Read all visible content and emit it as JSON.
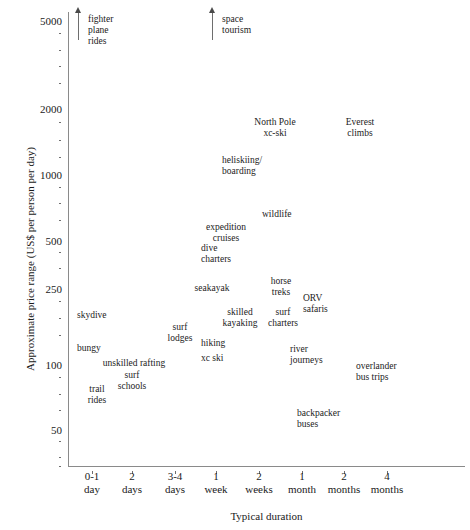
{
  "chart_data": {
    "type": "scatter",
    "title": "",
    "xlabel": "Typical duration",
    "ylabel": "Approximate price range (US$ per person per day)",
    "yscale": "log",
    "ylim": [
      30,
      6000
    ],
    "y_tick_labels": [
      "5000",
      "2000",
      "1000",
      "500",
      "250",
      "100",
      "50"
    ],
    "y_tick_values": [
      5000,
      2000,
      1000,
      500,
      250,
      100,
      50
    ],
    "x_tick_labels": [
      {
        "line1": "0-1",
        "line2": "day"
      },
      {
        "line1": "2",
        "line2": "days"
      },
      {
        "line1": "3-4",
        "line2": "days"
      },
      {
        "line1": "1",
        "line2": "week"
      },
      {
        "line1": "2",
        "line2": "weeks"
      },
      {
        "line1": "1",
        "line2": "month"
      },
      {
        "line1": "2",
        "line2": "months"
      },
      {
        "line1": "4",
        "line2": "months"
      }
    ],
    "grid": false,
    "legend": "none",
    "points": [
      {
        "label": "fighter\nplane\nrides",
        "x_category": "0-1 day",
        "y_value": 5000,
        "off_scale": true,
        "align": "left"
      },
      {
        "label": "space\ntourism",
        "x_category": "1 week",
        "y_value": 5000,
        "off_scale": true,
        "align": "left"
      },
      {
        "label": "North Pole\nxc-ski",
        "x_category": "2 weeks",
        "y_value": 1700,
        "off_scale": false,
        "align": "center"
      },
      {
        "label": "Everest\nclimbs",
        "x_category": "2 months",
        "y_value": 1700,
        "off_scale": false,
        "align": "center"
      },
      {
        "label": "heliskiing/\nboarding",
        "x_category": "1 week",
        "y_value": 1050,
        "off_scale": false,
        "align": "left"
      },
      {
        "label": "expedition\ncruises",
        "x_category": "2 weeks",
        "y_value": 560,
        "off_scale": false,
        "align": "left"
      },
      {
        "label": "wildlife",
        "x_category": "1 week",
        "y_value": 500,
        "off_scale": false,
        "align": "center"
      },
      {
        "label": "dive\ncharters",
        "x_category": "1 week",
        "y_value": 400,
        "off_scale": false,
        "align": "left"
      },
      {
        "label": "seakayak",
        "x_category": "1 week",
        "y_value": 270,
        "off_scale": false,
        "align": "center"
      },
      {
        "label": "horse\ntreks",
        "x_category": "2 weeks",
        "y_value": 270,
        "off_scale": false,
        "align": "center"
      },
      {
        "label": "ORV\nsafaris",
        "x_category": "1 month",
        "y_value": 245,
        "off_scale": false,
        "align": "left"
      },
      {
        "label": "skilled\nkayaking",
        "x_category": "1 week",
        "y_value": 200,
        "off_scale": false,
        "align": "center"
      },
      {
        "label": "surf\ncharters",
        "x_category": "2 weeks",
        "y_value": 200,
        "off_scale": false,
        "align": "center"
      },
      {
        "label": "skydive",
        "x_category": "0-1 day",
        "y_value": 190,
        "off_scale": false,
        "align": "left"
      },
      {
        "label": "surf\nlodges",
        "x_category": "3-4 days",
        "y_value": 160,
        "off_scale": false,
        "align": "center"
      },
      {
        "label": "hiking",
        "x_category": "1 week",
        "y_value": 140,
        "off_scale": false,
        "align": "left"
      },
      {
        "label": "bungy",
        "x_category": "0-1 day",
        "y_value": 135,
        "off_scale": false,
        "align": "left"
      },
      {
        "label": "river\njourneys",
        "x_category": "1 month",
        "y_value": 128,
        "off_scale": false,
        "align": "left"
      },
      {
        "label": "xc ski",
        "x_category": "1 week",
        "y_value": 115,
        "off_scale": false,
        "align": "left"
      },
      {
        "label": "unskilled rafting",
        "x_category": "2 days",
        "y_value": 105,
        "off_scale": false,
        "align": "center"
      },
      {
        "label": "overlander\nbus trips",
        "x_category": "2 months",
        "y_value": 100,
        "off_scale": false,
        "align": "left"
      },
      {
        "label": "surf\nschools",
        "x_category": "2 days",
        "y_value": 92,
        "off_scale": false,
        "align": "center"
      },
      {
        "label": "trail\nrides",
        "x_category": "0-1 day",
        "y_value": 85,
        "off_scale": false,
        "align": "center"
      },
      {
        "label": "backpacker\nbuses",
        "x_category": "1 month",
        "y_value": 52,
        "off_scale": false,
        "align": "left"
      }
    ]
  },
  "layout": {
    "y_ticks_px": [
      {
        "label": "5000",
        "top": 16
      },
      {
        "label": "2000",
        "top": 104
      },
      {
        "label": "1000",
        "top": 170
      },
      {
        "label": "500",
        "top": 236
      },
      {
        "label": "250",
        "top": 284
      },
      {
        "label": "100",
        "top": 360
      },
      {
        "label": "50",
        "top": 425
      }
    ],
    "y_minor_dots_px": [
      33,
      50,
      66,
      83,
      122,
      140,
      157,
      187,
      203,
      220,
      252,
      268,
      301,
      318,
      335,
      377,
      394,
      410,
      441,
      457,
      466
    ],
    "x_ticks_px": [
      92,
      132,
      175,
      216,
      259,
      302,
      344,
      387
    ],
    "arrows": [
      {
        "name": "fighter-plane-rides-arrow",
        "left": 78,
        "top": 12,
        "height": 28
      },
      {
        "name": "space-tourism-arrow",
        "left": 212,
        "top": 12,
        "height": 28
      }
    ],
    "labels_px": [
      {
        "name": "fighter-plane-rides-label",
        "left": 88,
        "top": 14,
        "align": "left"
      },
      {
        "name": "space-tourism-label",
        "left": 222,
        "top": 14,
        "align": "left"
      },
      {
        "name": "north-pole-xc-ski-label",
        "left": 275,
        "top": 117,
        "align": "center"
      },
      {
        "name": "everest-climbs-label",
        "left": 360,
        "top": 117,
        "align": "center"
      },
      {
        "name": "heliskiing-boarding-label",
        "left": 222,
        "top": 155,
        "align": "left"
      },
      {
        "name": "wildlife-label",
        "left": 226,
        "top": 222,
        "align": "center"
      },
      {
        "name": "expedition-cruises-label",
        "left": 262,
        "top": 209,
        "align": "left"
      },
      {
        "name": "dive-charters-label",
        "left": 201,
        "top": 243,
        "align": "left"
      },
      {
        "name": "seakayak-label",
        "left": 212,
        "top": 283,
        "align": "center"
      },
      {
        "name": "horse-treks-label",
        "left": 281,
        "top": 276,
        "align": "center"
      },
      {
        "name": "orv-safaris-label",
        "left": 303,
        "top": 293,
        "align": "left"
      },
      {
        "name": "skilled-kayaking-label",
        "left": 240,
        "top": 307,
        "align": "center"
      },
      {
        "name": "surf-charters-label",
        "left": 283,
        "top": 307,
        "align": "center"
      },
      {
        "name": "skydive-label",
        "left": 77,
        "top": 310,
        "align": "left"
      },
      {
        "name": "surf-lodges-label",
        "left": 180,
        "top": 322,
        "align": "center"
      },
      {
        "name": "hiking-label",
        "left": 201,
        "top": 338,
        "align": "left"
      },
      {
        "name": "bungy-label",
        "left": 77,
        "top": 343,
        "align": "left"
      },
      {
        "name": "river-journeys-label",
        "left": 290,
        "top": 344,
        "align": "left"
      },
      {
        "name": "xc-ski-label",
        "left": 201,
        "top": 353,
        "align": "left"
      },
      {
        "name": "unskilled-rafting-label",
        "left": 134,
        "top": 358,
        "align": "center"
      },
      {
        "name": "overlander-bus-trips-label",
        "left": 356,
        "top": 361,
        "align": "left"
      },
      {
        "name": "surf-schools-label",
        "left": 132,
        "top": 370,
        "align": "center"
      },
      {
        "name": "trail-rides-label",
        "left": 97,
        "top": 384,
        "align": "center"
      },
      {
        "name": "backpacker-buses-label",
        "left": 297,
        "top": 408,
        "align": "left"
      }
    ]
  }
}
